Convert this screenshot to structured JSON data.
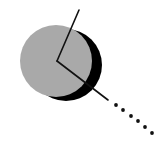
{
  "illustration": {
    "label": "Gray disc with drop shadow, two radial lines and dotted continuation",
    "colors": {
      "disc_fill": "#a9a9a9",
      "shadow_fill": "#000000",
      "line_color": "#111111",
      "background": "#ffffff"
    },
    "disc": {
      "cx": 56,
      "cy": 61,
      "rx": 36,
      "ry": 36
    },
    "shadow": {
      "cx": 66,
      "cy": 65,
      "rx": 36,
      "ry": 36
    },
    "center_point": {
      "x": 57,
      "y": 61
    },
    "upper_line_end": {
      "x": 79,
      "y": 10
    },
    "lower_line_end": {
      "x": 108,
      "y": 100
    },
    "dots": [
      {
        "x": 116,
        "y": 105
      },
      {
        "x": 123,
        "y": 110
      },
      {
        "x": 131,
        "y": 116
      },
      {
        "x": 138,
        "y": 121
      },
      {
        "x": 145,
        "y": 127
      },
      {
        "x": 152,
        "y": 133
      }
    ]
  }
}
